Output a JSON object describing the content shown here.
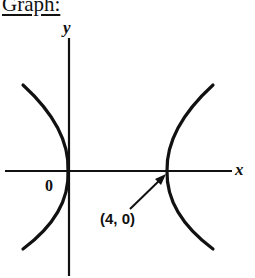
{
  "header": {
    "title": "Graph:"
  },
  "graph": {
    "y_axis_label": "y",
    "x_axis_label": "x",
    "origin_label": "0",
    "point_label": "(4, 0)",
    "curve_color": "#111111",
    "axis_color": "#111111"
  }
}
